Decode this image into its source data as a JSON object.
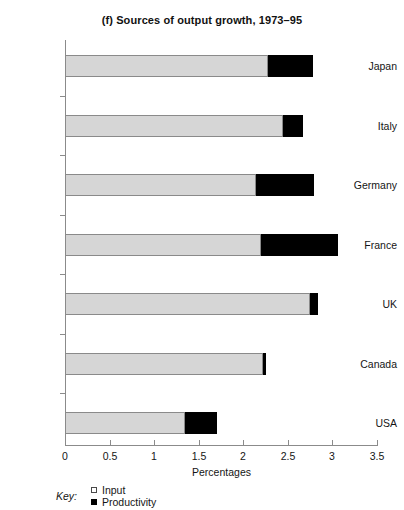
{
  "chart_data": {
    "type": "bar",
    "orientation": "horizontal",
    "stacked": true,
    "title": "(f) Sources of output growth, 1973–95",
    "xlabel": "Percentages",
    "ylabel": "",
    "xlim": [
      0,
      3.5
    ],
    "xticks": [
      "0",
      "0.5",
      "1",
      "1.5",
      "2",
      "2.5",
      "3",
      "3.5"
    ],
    "xtick_values": [
      0,
      0.5,
      1,
      1.5,
      2,
      2.5,
      3,
      3.5
    ],
    "grid": false,
    "legend_position": "below-axis-left",
    "legend_title": "Key:",
    "categories": [
      "Japan",
      "Italy",
      "Germany",
      "France",
      "UK",
      "Canada",
      "USA"
    ],
    "series": [
      {
        "name": "Input",
        "color": "#d6d6d6",
        "values": [
          2.28,
          2.45,
          2.14,
          2.2,
          2.75,
          2.22,
          1.35
        ]
      },
      {
        "name": "Productivity",
        "color": "#000000",
        "values": [
          0.5,
          0.22,
          0.65,
          0.86,
          0.09,
          0.04,
          0.35
        ]
      }
    ],
    "totals": [
      2.78,
      2.67,
      2.79,
      3.06,
      2.84,
      2.26,
      1.7
    ]
  },
  "legend": {
    "key_label": "Key:",
    "entries": [
      {
        "label": "Input",
        "swatch": "open-square"
      },
      {
        "label": "Productivity",
        "swatch": "filled-square"
      }
    ]
  },
  "colors": {
    "input": "#d6d6d6",
    "productivity": "#000000",
    "axis": "#8b8b8b",
    "text": "#151515",
    "background": "#ffffff"
  }
}
